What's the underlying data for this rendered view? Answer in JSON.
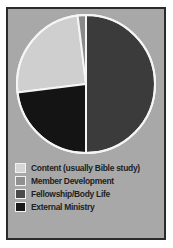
{
  "figure": {
    "panel_background": "#a8a8a8",
    "frame_color": "#2b2b2b",
    "page_background": "#ffffff"
  },
  "chart_data": {
    "type": "pie",
    "title": "",
    "subtitle": "",
    "xlabel": "",
    "ylabel": "",
    "grid": false,
    "legend_position": "bottom-left",
    "start_angle_deg": 0,
    "direction": "clockwise",
    "slice_outline_color": "#f5f5f5",
    "categories": [
      "Content (usually Bible study)",
      "Member Development",
      "Fellowship/Body Life",
      "External Ministry"
    ],
    "values": [
      30,
      7,
      50,
      13
    ],
    "colors": [
      "#cfcfcf",
      "#8a8a8a",
      "#3b3b3b",
      "#141414"
    ],
    "slices": [
      {
        "label": "Content (usually Bible study)",
        "value": 30,
        "color": "#cfcfcf",
        "start_deg": 263,
        "end_deg": 353
      },
      {
        "label": "Member Development",
        "value": 7,
        "color": "#8a8a8a",
        "start_deg": 353,
        "end_deg": 360
      },
      {
        "label": "Fellowship/Body Life",
        "value": 50,
        "color": "#3b3b3b",
        "start_deg": 0,
        "end_deg": 180
      },
      {
        "label": "External Ministry",
        "value": 13,
        "color": "#141414",
        "start_deg": 180,
        "end_deg": 263
      }
    ]
  },
  "legend": {
    "items": [
      {
        "label": "Content (usually Bible study)",
        "color": "#d6d6d6"
      },
      {
        "label": "Member Development",
        "color": "#8f8f8f"
      },
      {
        "label": "Fellowship/Body Life",
        "color": "#4a4a4a"
      },
      {
        "label": "External Ministry",
        "color": "#1a1a1a"
      }
    ]
  }
}
